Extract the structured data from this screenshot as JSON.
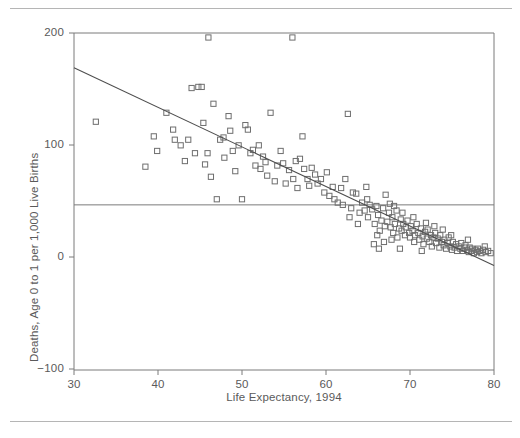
{
  "chart_data": {
    "type": "scatter",
    "title": "",
    "xlabel": "Life Expectancy, 1994",
    "ylabel": "Deaths, Age 0 to 1 per 1,000 Live Births",
    "xlim": [
      30,
      80
    ],
    "ylim": [
      -100,
      200
    ],
    "xticks": [
      30,
      40,
      50,
      60,
      70,
      80
    ],
    "yticks": [
      -100,
      0,
      100,
      200
    ],
    "xtick_labels": [
      "30",
      "40",
      "50",
      "60",
      "70",
      "80"
    ],
    "ytick_labels": [
      "−100",
      "0",
      "100",
      "200"
    ],
    "grid": false,
    "legend": null,
    "marker": "open-square",
    "marker_color": "#6e6e6e",
    "line_color": "#4d4d4d",
    "frame_color": "#7a7a7a",
    "reference_line": {
      "orientation": "horizontal",
      "y": 47,
      "label": ""
    },
    "fit_line": {
      "kind": "linear-regression",
      "x_start": 30,
      "y_start": 169,
      "x_end": 80,
      "y_end": -7
    },
    "points": [
      [
        32.6,
        121
      ],
      [
        38.5,
        81
      ],
      [
        39.5,
        108
      ],
      [
        39.9,
        95
      ],
      [
        41.0,
        129
      ],
      [
        41.8,
        114
      ],
      [
        42.0,
        105
      ],
      [
        42.7,
        100
      ],
      [
        43.2,
        86
      ],
      [
        43.6,
        105
      ],
      [
        44.0,
        151
      ],
      [
        44.4,
        93
      ],
      [
        44.8,
        152
      ],
      [
        45.2,
        152
      ],
      [
        45.4,
        120
      ],
      [
        45.6,
        83
      ],
      [
        45.9,
        93
      ],
      [
        46.0,
        196
      ],
      [
        46.3,
        72
      ],
      [
        46.6,
        137
      ],
      [
        47.0,
        52
      ],
      [
        47.4,
        105
      ],
      [
        47.8,
        107
      ],
      [
        47.9,
        89
      ],
      [
        48.4,
        126
      ],
      [
        48.6,
        113
      ],
      [
        48.9,
        95
      ],
      [
        49.2,
        77
      ],
      [
        49.6,
        100
      ],
      [
        50.0,
        52
      ],
      [
        50.4,
        118
      ],
      [
        50.7,
        114
      ],
      [
        51.0,
        93
      ],
      [
        51.3,
        96
      ],
      [
        51.6,
        82
      ],
      [
        52.0,
        100
      ],
      [
        52.2,
        79
      ],
      [
        52.5,
        90
      ],
      [
        52.8,
        85
      ],
      [
        53.0,
        73
      ],
      [
        53.4,
        129
      ],
      [
        53.9,
        68
      ],
      [
        54.2,
        82
      ],
      [
        54.6,
        95
      ],
      [
        54.9,
        84
      ],
      [
        55.2,
        66
      ],
      [
        55.6,
        78
      ],
      [
        56.0,
        196
      ],
      [
        56.1,
        70
      ],
      [
        56.4,
        86
      ],
      [
        56.6,
        62
      ],
      [
        56.9,
        88
      ],
      [
        57.2,
        108
      ],
      [
        57.4,
        79
      ],
      [
        57.8,
        70
      ],
      [
        58.0,
        64
      ],
      [
        58.3,
        80
      ],
      [
        58.7,
        74
      ],
      [
        59.0,
        66
      ],
      [
        59.4,
        70
      ],
      [
        59.8,
        58
      ],
      [
        60.1,
        76
      ],
      [
        60.4,
        55
      ],
      [
        60.8,
        63
      ],
      [
        61.0,
        52
      ],
      [
        61.4,
        49
      ],
      [
        61.8,
        62
      ],
      [
        62.0,
        47
      ],
      [
        62.3,
        70
      ],
      [
        62.6,
        128
      ],
      [
        63.0,
        44
      ],
      [
        63.2,
        58
      ],
      [
        63.6,
        57
      ],
      [
        64.0,
        40
      ],
      [
        64.3,
        49
      ],
      [
        64.6,
        42
      ],
      [
        64.8,
        63
      ],
      [
        65.0,
        36
      ],
      [
        65.2,
        47
      ],
      [
        65.5,
        43
      ],
      [
        65.8,
        30
      ],
      [
        66.0,
        46
      ],
      [
        66.2,
        38
      ],
      [
        66.4,
        24
      ],
      [
        66.6,
        33
      ],
      [
        66.8,
        44
      ],
      [
        67.0,
        28
      ],
      [
        67.1,
        56
      ],
      [
        67.3,
        32
      ],
      [
        67.5,
        40
      ],
      [
        67.7,
        27
      ],
      [
        67.9,
        36
      ],
      [
        68.0,
        22
      ],
      [
        68.2,
        30
      ],
      [
        68.4,
        42
      ],
      [
        68.5,
        18
      ],
      [
        68.7,
        26
      ],
      [
        68.9,
        34
      ],
      [
        69.0,
        24
      ],
      [
        69.2,
        30
      ],
      [
        69.4,
        20
      ],
      [
        69.5,
        27
      ],
      [
        69.7,
        33
      ],
      [
        69.9,
        22
      ],
      [
        70.0,
        18
      ],
      [
        70.1,
        28
      ],
      [
        70.3,
        24
      ],
      [
        70.5,
        14
      ],
      [
        70.6,
        20
      ],
      [
        70.8,
        30
      ],
      [
        71.0,
        22
      ],
      [
        71.1,
        16
      ],
      [
        71.3,
        26
      ],
      [
        71.5,
        19
      ],
      [
        71.6,
        12
      ],
      [
        71.8,
        23
      ],
      [
        72.0,
        17
      ],
      [
        72.1,
        25
      ],
      [
        72.3,
        14
      ],
      [
        72.5,
        20
      ],
      [
        72.6,
        10
      ],
      [
        72.8,
        18
      ],
      [
        73.0,
        22
      ],
      [
        73.1,
        13
      ],
      [
        73.3,
        17
      ],
      [
        73.5,
        9
      ],
      [
        73.6,
        20
      ],
      [
        73.8,
        14
      ],
      [
        74.0,
        11
      ],
      [
        74.1,
        16
      ],
      [
        74.3,
        8
      ],
      [
        74.5,
        13
      ],
      [
        74.6,
        18
      ],
      [
        74.8,
        10
      ],
      [
        75.0,
        7
      ],
      [
        75.1,
        14
      ],
      [
        75.3,
        9
      ],
      [
        75.5,
        12
      ],
      [
        75.6,
        6
      ],
      [
        75.8,
        10
      ],
      [
        76.0,
        8
      ],
      [
        76.1,
        13
      ],
      [
        76.3,
        6
      ],
      [
        76.5,
        9
      ],
      [
        76.6,
        11
      ],
      [
        76.8,
        7
      ],
      [
        77.0,
        5
      ],
      [
        77.1,
        9
      ],
      [
        77.3,
        6
      ],
      [
        77.4,
        8
      ],
      [
        77.6,
        4
      ],
      [
        77.8,
        7
      ],
      [
        78.0,
        5
      ],
      [
        78.1,
        8
      ],
      [
        78.3,
        6
      ],
      [
        78.5,
        4
      ],
      [
        78.7,
        7
      ],
      [
        79.0,
        5
      ],
      [
        79.3,
        6
      ],
      [
        79.6,
        4
      ],
      [
        66.1,
        20
      ],
      [
        66.9,
        14
      ],
      [
        67.6,
        48
      ],
      [
        68.1,
        46
      ],
      [
        64.9,
        52
      ],
      [
        65.7,
        12
      ],
      [
        63.8,
        30
      ],
      [
        62.8,
        36
      ],
      [
        70.4,
        36
      ],
      [
        71.9,
        31
      ],
      [
        73.9,
        25
      ],
      [
        72.9,
        28
      ],
      [
        69.1,
        40
      ],
      [
        68.8,
        8
      ],
      [
        71.4,
        6
      ],
      [
        74.9,
        20
      ],
      [
        76.9,
        16
      ],
      [
        78.9,
        10
      ],
      [
        66.3,
        8
      ],
      [
        67.8,
        16
      ]
    ]
  },
  "axis": {
    "x_title": "Life Expectancy, 1994",
    "y_title": "Deaths, Age 0 to 1 per 1,000 Live Births",
    "y_labels": [
      "200",
      "100",
      "0",
      "−100"
    ],
    "x_labels": [
      "30",
      "40",
      "50",
      "60",
      "70",
      "80"
    ]
  }
}
